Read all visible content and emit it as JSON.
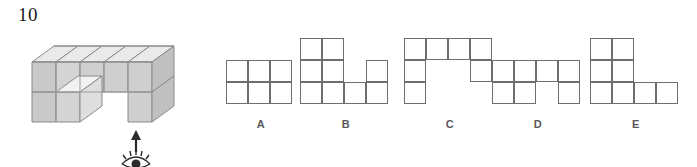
{
  "question": {
    "number": "10"
  },
  "solid": {
    "description": "u-shaped-cube-stack",
    "face_colors": {
      "top": "#eaeaea",
      "left": "#c3c3c3",
      "front": "#d9d9d9",
      "outline": "#8a8a8a"
    },
    "cube_count": 12
  },
  "view_indicator": {
    "arrow_name": "up-arrow",
    "eye_name": "eye-icon",
    "color": "#2a2a2a"
  },
  "options": [
    {
      "id": "A",
      "label": "A",
      "cols": 3,
      "rows": 2,
      "cells": [
        [
          0,
          0
        ],
        [
          1,
          0
        ],
        [
          2,
          0
        ],
        [
          0,
          1
        ],
        [
          1,
          1
        ],
        [
          2,
          1
        ]
      ]
    },
    {
      "id": "B",
      "label": "B",
      "cols": 4,
      "rows": 3,
      "cells": [
        [
          0,
          0
        ],
        [
          1,
          0
        ],
        [
          0,
          1
        ],
        [
          1,
          1
        ],
        [
          3,
          1
        ],
        [
          0,
          2
        ],
        [
          1,
          2
        ],
        [
          2,
          2
        ],
        [
          3,
          2
        ]
      ]
    },
    {
      "id": "C",
      "label": "C",
      "cols": 4,
      "rows": 3,
      "cells": [
        [
          0,
          0
        ],
        [
          1,
          0
        ],
        [
          2,
          0
        ],
        [
          3,
          0
        ],
        [
          0,
          1
        ],
        [
          3,
          1
        ],
        [
          0,
          2
        ]
      ]
    },
    {
      "id": "D",
      "label": "D",
      "cols": 4,
      "rows": 2,
      "cells": [
        [
          0,
          0
        ],
        [
          1,
          0
        ],
        [
          2,
          0
        ],
        [
          3,
          0
        ],
        [
          0,
          1
        ],
        [
          1,
          1
        ],
        [
          3,
          1
        ]
      ]
    },
    {
      "id": "E",
      "label": "E",
      "cols": 4,
      "rows": 3,
      "cells": [
        [
          0,
          0
        ],
        [
          1,
          0
        ],
        [
          0,
          1
        ],
        [
          1,
          1
        ],
        [
          0,
          2
        ],
        [
          1,
          2
        ],
        [
          2,
          2
        ],
        [
          3,
          2
        ]
      ]
    }
  ],
  "grid_style": {
    "cell_size": 22,
    "stroke": "#6e6e72",
    "fill": "#ffffff"
  }
}
